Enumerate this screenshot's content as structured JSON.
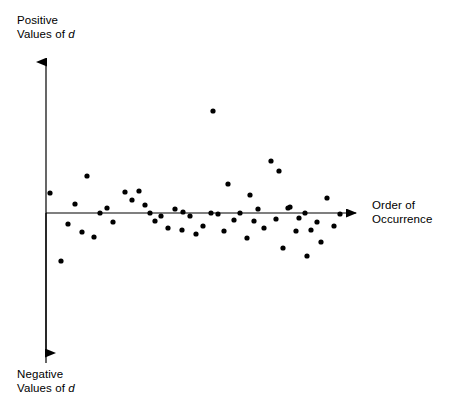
{
  "figure": {
    "title": "",
    "background_color": "#ffffff",
    "ink_color": "#000000"
  },
  "labels": {
    "positive_line1": "Positive",
    "positive_line2_prefix": "Values of ",
    "positive_variable": "d",
    "negative_line1": "Negative",
    "negative_line2_prefix": "Values of ",
    "negative_variable": "d",
    "order_line1": "Order of",
    "order_line2": "Occurrence"
  },
  "chart_data": {
    "type": "scatter",
    "title": "",
    "subtitle": "",
    "xlabel": "Order of Occurrence",
    "ylabel": "Values of d",
    "ylabel_positive": "Positive Values of d",
    "ylabel_negative": "Negative Values of d",
    "grid": false,
    "legend": false,
    "legend_position": "none",
    "axis_style": "arrow-both-ends-vertical-and-right",
    "marker": {
      "shape": "circle",
      "color": "#000000",
      "radius_px": 2.6
    },
    "axes_pixels": {
      "origin_x": 46,
      "origin_y": 213,
      "y_axis_top": 52,
      "y_axis_bottom": 363,
      "x_axis_right": 366,
      "line_color": "#000000",
      "line_width_px": 1.2
    },
    "xlim": [
      0,
      60
    ],
    "ylim": [
      -1,
      1
    ],
    "n_points": 52,
    "points_pixels": [
      [
        50,
        193
      ],
      [
        61,
        261
      ],
      [
        68,
        224
      ],
      [
        75,
        204
      ],
      [
        82,
        232
      ],
      [
        87,
        176
      ],
      [
        100,
        213
      ],
      [
        113,
        222
      ],
      [
        125,
        192
      ],
      [
        132,
        200
      ],
      [
        139,
        191
      ],
      [
        145,
        205
      ],
      [
        155,
        221
      ],
      [
        161,
        216
      ],
      [
        168,
        228
      ],
      [
        175,
        209
      ],
      [
        182,
        230
      ],
      [
        183,
        212
      ],
      [
        196,
        234
      ],
      [
        203,
        226
      ],
      [
        213,
        111
      ],
      [
        218,
        214
      ],
      [
        224,
        231
      ],
      [
        228,
        184
      ],
      [
        234,
        220
      ],
      [
        240,
        213
      ],
      [
        247,
        238
      ],
      [
        250,
        195
      ],
      [
        258,
        209
      ],
      [
        264,
        228
      ],
      [
        271,
        161
      ],
      [
        276,
        219
      ],
      [
        279,
        171
      ],
      [
        283,
        248
      ],
      [
        288,
        208
      ],
      [
        290,
        207
      ],
      [
        296,
        231
      ],
      [
        299,
        218
      ],
      [
        305,
        213
      ],
      [
        307,
        256
      ],
      [
        311,
        230
      ],
      [
        317,
        222
      ],
      [
        321,
        242
      ],
      [
        327,
        198
      ],
      [
        334,
        226
      ],
      [
        340,
        214
      ],
      [
        94,
        237
      ],
      [
        107,
        208
      ],
      [
        150,
        213
      ],
      [
        190,
        216
      ],
      [
        211,
        213
      ],
      [
        254,
        221
      ]
    ],
    "values": {
      "x": [
        50,
        61,
        68,
        75,
        82,
        87,
        100,
        113,
        125,
        132,
        139,
        145,
        155,
        161,
        168,
        175,
        182,
        183,
        196,
        203,
        213,
        218,
        224,
        228,
        234,
        240,
        247,
        250,
        258,
        264,
        271,
        276,
        279,
        283,
        288,
        290,
        296,
        299,
        305,
        307,
        311,
        317,
        321,
        327,
        334,
        340,
        94,
        107,
        150,
        190,
        211,
        254
      ],
      "y": [
        20,
        -48,
        -11,
        9,
        -19,
        37,
        0,
        -9,
        21,
        13,
        22,
        8,
        -8,
        -3,
        -15,
        4,
        -17,
        1,
        -21,
        -13,
        102,
        -1,
        -18,
        29,
        -7,
        0,
        -25,
        18,
        4,
        -15,
        52,
        -6,
        42,
        -35,
        5,
        6,
        -18,
        -5,
        0,
        -43,
        -17,
        -9,
        -29,
        15,
        -13,
        -1,
        -24,
        5,
        0,
        -3,
        0,
        -8
      ]
    }
  }
}
